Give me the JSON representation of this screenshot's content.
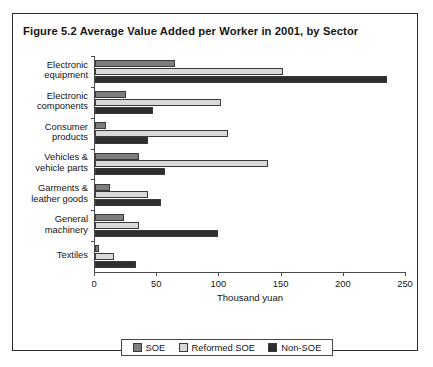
{
  "figure": {
    "title": "Figure 5.2  Average Value Added per Worker in 2001, by Sector"
  },
  "chart_data": {
    "type": "bar",
    "orientation": "horizontal",
    "title": "Figure 5.2  Average Value Added per Worker in 2001, by Sector",
    "xlabel": "Thousand yuan",
    "ylabel": "",
    "xlim": [
      0,
      250
    ],
    "xticks": [
      0,
      50,
      100,
      150,
      200,
      250
    ],
    "xtick_labels": [
      "0",
      "50",
      "100",
      "150",
      "200",
      "250"
    ],
    "grid": false,
    "legend_position": "bottom",
    "categories": [
      "Electronic equipment",
      "Electronic components",
      "Consumer products",
      "Vehicles & vehicle parts",
      "Garments & leather goods",
      "General machinery",
      "Textiles"
    ],
    "category_lines": [
      [
        "Electronic",
        "equipment"
      ],
      [
        "Electronic",
        "components"
      ],
      [
        "Consumer",
        "products"
      ],
      [
        "Vehicles &",
        "vehicle parts"
      ],
      [
        "Garments &",
        "leather goods"
      ],
      [
        "General",
        "machinery"
      ],
      [
        "Textiles",
        ""
      ]
    ],
    "series": [
      {
        "name": "SOE",
        "color": "#7d7d7d",
        "values": [
          64,
          25,
          9,
          35,
          12,
          23,
          3
        ]
      },
      {
        "name": "Reformed SOE",
        "color": "#d9d9d9",
        "values": [
          151,
          101,
          107,
          139,
          43,
          35,
          15
        ]
      },
      {
        "name": "Non-SOE",
        "color": "#2e2e2e",
        "values": [
          235,
          47,
          43,
          56,
          53,
          99,
          33
        ]
      }
    ]
  },
  "legend": {
    "items": [
      {
        "label": "SOE",
        "color": "#7d7d7d"
      },
      {
        "label": "Reformed SOE",
        "color": "#d9d9d9"
      },
      {
        "label": "Non-SOE",
        "color": "#2e2e2e"
      }
    ]
  }
}
